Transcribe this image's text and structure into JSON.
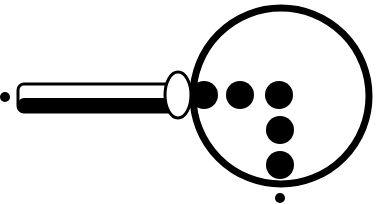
{
  "diagram": {
    "description": "Magnifying glass with braille-like dots",
    "colors": {
      "ink": "#000000",
      "background": "#ffffff"
    },
    "lens": {
      "cx": 281,
      "cy": 96,
      "r": 88,
      "stroke_width": 7
    },
    "handle": {
      "x": 18,
      "y": 84,
      "width": 160,
      "height": 28,
      "rx": 6
    },
    "ferrule": {
      "cx": 178,
      "cy": 95,
      "rx": 13,
      "ry": 23
    },
    "dots": [
      {
        "cx": 204,
        "cy": 95,
        "r": 14
      },
      {
        "cx": 240,
        "cy": 95,
        "r": 14
      },
      {
        "cx": 279,
        "cy": 95,
        "r": 14
      },
      {
        "cx": 280,
        "cy": 130,
        "r": 14
      },
      {
        "cx": 280,
        "cy": 165,
        "r": 14
      }
    ],
    "small_dots": [
      {
        "cx": 5,
        "cy": 97,
        "r": 5
      },
      {
        "cx": 280,
        "cy": 198,
        "r": 5
      }
    ]
  }
}
